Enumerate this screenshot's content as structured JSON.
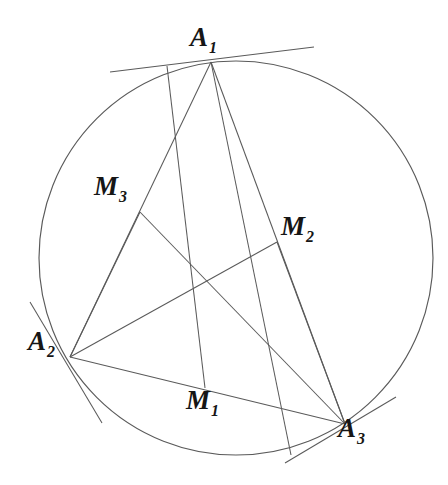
{
  "figure": {
    "kind": "euclidean-geometry-diagram",
    "stroke_color": "#5a5a5a",
    "label_color": "#161616",
    "background_color": "#ffffff",
    "width": 448,
    "height": 485
  },
  "circle": {
    "name": "circumcircle",
    "cx": 236,
    "cy": 258,
    "r": 197
  },
  "points": [
    {
      "id": "A1",
      "label": "A",
      "subscript": "1",
      "x": 211,
      "y": 62
    },
    {
      "id": "A2",
      "label": "A",
      "subscript": "2",
      "x": 70,
      "y": 357
    },
    {
      "id": "A3",
      "label": "A",
      "subscript": "3",
      "x": 345,
      "y": 424
    },
    {
      "id": "M1",
      "label": "M",
      "subscript": "1",
      "x": 205,
      "y": 388
    },
    {
      "id": "M2",
      "label": "M",
      "subscript": "2",
      "x": 277,
      "y": 242
    },
    {
      "id": "M3",
      "label": "M",
      "subscript": "3",
      "x": 140,
      "y": 212
    },
    {
      "id": "P",
      "label": "",
      "subscript": "",
      "x": 192,
      "y": 293
    }
  ],
  "segments": [
    {
      "name": "side-a1-a2",
      "x1": 211,
      "y1": 62,
      "x2": 70,
      "y2": 357
    },
    {
      "name": "side-a1-a3",
      "x1": 211,
      "y1": 62,
      "x2": 345,
      "y2": 424
    },
    {
      "name": "side-a2-a3",
      "x1": 70,
      "y1": 357,
      "x2": 345,
      "y2": 424
    },
    {
      "name": "cevian-a1-m1",
      "x1": 167,
      "y1": 66,
      "x2": 205,
      "y2": 388
    },
    {
      "name": "cevian-a2-m2",
      "x1": 70,
      "y1": 357,
      "x2": 277,
      "y2": 242
    },
    {
      "name": "cevian-a3-m3",
      "x1": 345,
      "y1": 424,
      "x2": 140,
      "y2": 212
    },
    {
      "name": "chord-m3-a2",
      "x1": 140,
      "y1": 212,
      "x2": 70,
      "y2": 357
    },
    {
      "name": "chord-a1-through-center",
      "x1": 211,
      "y1": 62,
      "x2": 291,
      "y2": 455
    },
    {
      "name": "chord-m2-a3-extension",
      "x1": 277,
      "y1": 242,
      "x2": 345,
      "y2": 424
    }
  ],
  "tangents": [
    {
      "name": "tangent-at-a1",
      "x1": 110,
      "y1": 72,
      "x2": 314,
      "y2": 47
    },
    {
      "name": "tangent-at-a2",
      "x1": 30,
      "y1": 302,
      "x2": 102,
      "y2": 423
    },
    {
      "name": "tangent-at-a3",
      "x1": 285,
      "y1": 463,
      "x2": 396,
      "y2": 397
    }
  ],
  "labels": {
    "a1": "A",
    "a1_sub": "1",
    "a2": "A",
    "a2_sub": "2",
    "a3": "A",
    "a3_sub": "3",
    "m1": "M",
    "m1_sub": "1",
    "m2": "M",
    "m2_sub": "2",
    "m3": "M",
    "m3_sub": "3"
  }
}
